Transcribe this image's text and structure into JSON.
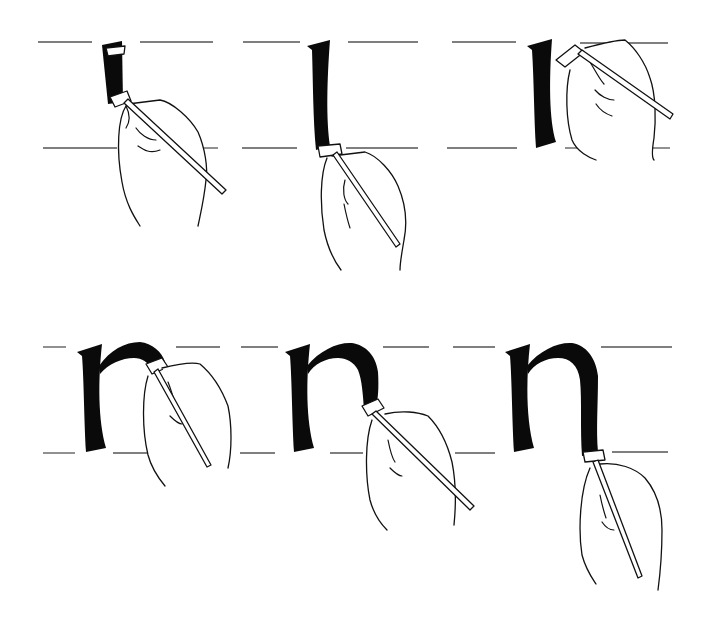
{
  "illustration": {
    "subject": "calligraphy stroke sequence for lowercase n with broad-nib pen",
    "colors": {
      "ink": "#0a0a0a",
      "paper": "#ffffff",
      "guideline": "#555555"
    },
    "rows": [
      {
        "guides": {
          "top_y": 42,
          "bottom_y": 148
        },
        "panels": [
          {
            "step": 1,
            "stroke": "stem-start",
            "letter_x": 104,
            "pen": [
              120,
              100
            ],
            "pen_end": [
              225,
              193
            ]
          },
          {
            "step": 2,
            "stroke": "stem-complete",
            "letter_x": 308,
            "pen": [
              330,
              150
            ],
            "pen_end": [
              398,
              244
            ]
          },
          {
            "step": 3,
            "stroke": "arch-start",
            "letter_x": 528,
            "pen": [
              560,
              56
            ],
            "pen_end": [
              672,
              118
            ]
          }
        ]
      },
      {
        "guides": {
          "top_y": 347,
          "bottom_y": 453
        },
        "panels": [
          {
            "step": 4,
            "stroke": "arch-begin",
            "letter_x": 77,
            "pen": [
              150,
              365
            ],
            "pen_end": [
              210,
              465
            ]
          },
          {
            "step": 5,
            "stroke": "arch-down",
            "letter_x": 285,
            "pen": [
              370,
              408
            ],
            "pen_end": [
              472,
              508
            ]
          },
          {
            "step": 6,
            "stroke": "letter-complete",
            "letter_x": 505,
            "pen": [
              590,
              456
            ],
            "pen_end": [
              640,
              575
            ]
          }
        ]
      }
    ]
  }
}
